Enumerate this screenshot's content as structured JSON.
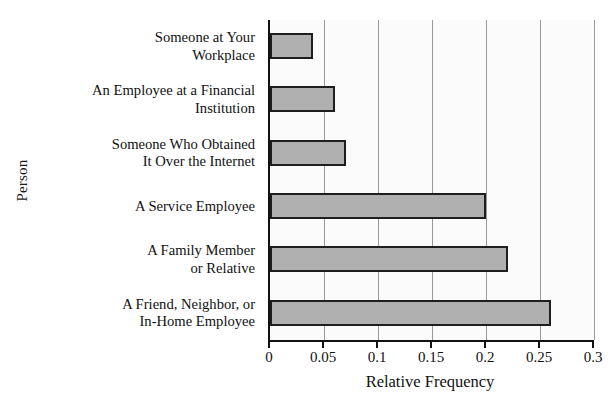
{
  "chart_data": {
    "type": "bar",
    "orientation": "horizontal",
    "title": "",
    "xlabel": "Relative Frequency",
    "ylabel": "Person",
    "categories": [
      "Someone at Your\nWorkplace",
      "An Employee at a Financial\nInstitution",
      "Someone Who Obtained\nIt Over the Internet",
      "A Service Employee",
      "A Family Member\nor Relative",
      "A Friend, Neighbor, or\nIn-Home Employee"
    ],
    "values": [
      0.04,
      0.06,
      0.07,
      0.2,
      0.22,
      0.26
    ],
    "xlim": [
      0,
      0.3
    ],
    "xticks": [
      0,
      0.05,
      0.1,
      0.15,
      0.2,
      0.25,
      0.3
    ],
    "xtick_labels": [
      "0",
      "0.05",
      "0.1",
      "0.15",
      "0.2",
      "0.25",
      "0.3"
    ],
    "grid": "vertical",
    "legend": "none",
    "bar_fill": "#b0b0b0",
    "bar_edge": "#1e1e1e",
    "gridline_color": "#9a9a9a",
    "plot_background": "#fbfbfb",
    "axis_color": "#111111"
  }
}
